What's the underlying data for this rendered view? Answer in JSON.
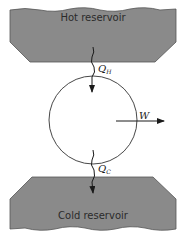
{
  "diagram": {
    "hot_reservoir": {
      "label": "Hot reservoir",
      "fill": "#8a8a8a"
    },
    "cold_reservoir": {
      "label": "Cold reservoir",
      "fill": "#8a8a8a"
    },
    "heat_in": {
      "symbol": "Q",
      "subscript": "H"
    },
    "heat_out": {
      "symbol": "Q",
      "subscript": "C"
    },
    "work": {
      "symbol": "W"
    },
    "engine": {
      "shape": "circle"
    }
  }
}
